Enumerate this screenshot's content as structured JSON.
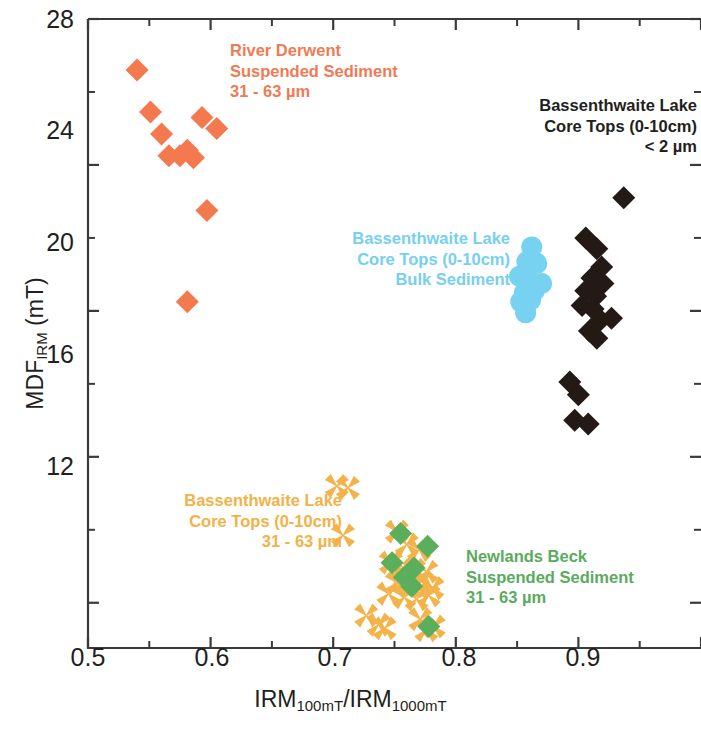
{
  "chart_data": {
    "type": "scatter",
    "title": "",
    "xlabel": "IRM100mT/IRM1000mT",
    "ylabel": "MDFIRM (mT)",
    "xlim": [
      0.5,
      1.0
    ],
    "ylim": [
      10.8,
      28.0
    ],
    "xticks": [
      0.5,
      0.6,
      0.7,
      0.8,
      0.9,
      1.0
    ],
    "xtick_labels": [
      "0.5",
      "0.6",
      "0.7",
      "0.8",
      "0.9",
      ""
    ],
    "x_minor_ticks": [
      0.55,
      0.65,
      0.75,
      0.85,
      0.95
    ],
    "yticks": [
      12,
      16,
      20,
      24,
      28
    ],
    "ytick_labels": [
      "12",
      "16",
      "20",
      "24",
      "28"
    ],
    "y_minor_ticks": [
      14,
      18,
      22,
      26
    ],
    "grid": false,
    "legend_position": "inline-annotations",
    "series": [
      {
        "name": "River Derwent Suspended Sediment 31 - 63 um",
        "marker": "diamond",
        "color": "#f4794f",
        "points": [
          [
            0.54,
            26.6
          ],
          [
            0.551,
            25.45
          ],
          [
            0.56,
            24.85
          ],
          [
            0.566,
            24.25
          ],
          [
            0.575,
            24.25
          ],
          [
            0.581,
            24.4
          ],
          [
            0.586,
            24.2
          ],
          [
            0.593,
            25.3
          ],
          [
            0.605,
            25.0
          ],
          [
            0.597,
            22.75
          ],
          [
            0.581,
            20.25
          ]
        ]
      },
      {
        "name": "Bassenthwaite Lake Core Tops (0-10cm) Bulk Sediment",
        "marker": "circle",
        "color": "#77d2f1",
        "points": [
          [
            0.862,
            21.75
          ],
          [
            0.858,
            21.35
          ],
          [
            0.866,
            21.3
          ],
          [
            0.852,
            20.95
          ],
          [
            0.86,
            20.8
          ],
          [
            0.87,
            20.75
          ],
          [
            0.856,
            20.5
          ],
          [
            0.864,
            20.55
          ],
          [
            0.853,
            20.25
          ],
          [
            0.861,
            20.3
          ],
          [
            0.857,
            19.95
          ]
        ]
      },
      {
        "name": "Bassenthwaite Lake Core Tops (0-10cm) < 2 um",
        "marker": "diamond",
        "color": "#231a16",
        "points": [
          [
            0.937,
            23.1
          ],
          [
            0.906,
            22.0
          ],
          [
            0.915,
            21.7
          ],
          [
            0.919,
            21.2
          ],
          [
            0.911,
            20.9
          ],
          [
            0.92,
            20.75
          ],
          [
            0.906,
            20.55
          ],
          [
            0.914,
            20.4
          ],
          [
            0.903,
            20.15
          ],
          [
            0.912,
            20.05
          ],
          [
            0.918,
            19.75
          ],
          [
            0.927,
            19.8
          ],
          [
            0.909,
            19.45
          ],
          [
            0.915,
            19.25
          ],
          [
            0.893,
            18.05
          ],
          [
            0.9,
            17.7
          ],
          [
            0.897,
            17.0
          ],
          [
            0.908,
            16.9
          ]
        ]
      },
      {
        "name": "Bassenthwaite Lake Core Tops (0-10cm) 31 - 63 um",
        "marker": "x",
        "color": "#f4b34a",
        "points": [
          [
            0.703,
            15.2
          ],
          [
            0.712,
            15.15
          ],
          [
            0.708,
            13.85
          ],
          [
            0.752,
            13.95
          ],
          [
            0.76,
            13.6
          ],
          [
            0.77,
            13.45
          ],
          [
            0.747,
            13.1
          ],
          [
            0.757,
            12.95
          ],
          [
            0.766,
            12.9
          ],
          [
            0.776,
            12.85
          ],
          [
            0.752,
            12.55
          ],
          [
            0.762,
            12.45
          ],
          [
            0.772,
            12.6
          ],
          [
            0.781,
            12.4
          ],
          [
            0.745,
            12.25
          ],
          [
            0.758,
            12.15
          ],
          [
            0.768,
            12.1
          ],
          [
            0.778,
            12.2
          ],
          [
            0.727,
            11.65
          ],
          [
            0.737,
            11.4
          ],
          [
            0.742,
            11.3
          ],
          [
            0.771,
            11.55
          ],
          [
            0.776,
            11.25
          ],
          [
            0.782,
            11.35
          ]
        ]
      },
      {
        "name": "Newlands Beck Suspended Sediment 31 - 63 um",
        "marker": "diamond",
        "color": "#5bae5c",
        "points": [
          [
            0.755,
            13.9
          ],
          [
            0.777,
            13.55
          ],
          [
            0.748,
            13.1
          ],
          [
            0.766,
            12.95
          ],
          [
            0.758,
            12.7
          ],
          [
            0.764,
            12.45
          ],
          [
            0.778,
            11.35
          ]
        ]
      }
    ]
  },
  "axes": {
    "y_title_main": "MDF",
    "y_title_sub": "IRM",
    "y_title_units": " (mT)",
    "x_title_p1": "IRM",
    "x_title_s1": "100mT",
    "x_title_mid": "/IRM",
    "x_title_s2": "1000mT",
    "ytick_labels": [
      "28",
      "24",
      "20",
      "16",
      "12"
    ],
    "xtick_labels": [
      "0.5",
      "0.6",
      "0.7",
      "0.8",
      "0.9"
    ]
  },
  "annotations": {
    "river_derwent": {
      "line1": "River Derwent",
      "line2": "Suspended Sediment",
      "line3": "31 - 63 µm",
      "color": "#ef7b55"
    },
    "bass_lt2um": {
      "line1": "Bassenthwaite Lake",
      "line2": "Core Tops (0-10cm)",
      "line3": "< 2 µm",
      "color": "#231f20"
    },
    "bass_bulk": {
      "line1": "Bassenthwaite Lake",
      "line2": "Core Tops (0-10cm)",
      "line3": "Bulk Sediment",
      "color": "#76d0f0"
    },
    "bass_3163": {
      "line1": "Bassenthwaite Lake",
      "line2": "Core Tops (0-10cm)",
      "line3": "31 - 63 µm",
      "color": "#f3b247"
    },
    "newlands_beck": {
      "line1": "Newlands Beck",
      "line2": "Suspended Sediment",
      "line3": "31 - 63 µm",
      "color": "#5aab5d"
    }
  }
}
